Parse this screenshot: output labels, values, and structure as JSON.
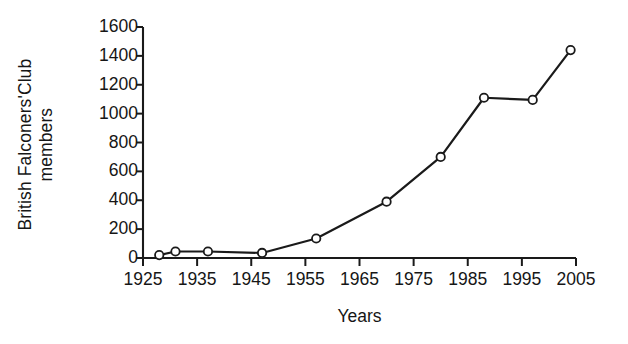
{
  "chart_data": {
    "type": "line",
    "title": "",
    "xlabel": "Years",
    "ylabel": "British Falconers'Club members",
    "ylabel_line1": "British Falconers'Club",
    "ylabel_line2": "members",
    "xlim": [
      1925,
      2005
    ],
    "ylim": [
      0,
      1600
    ],
    "xticks": [
      1925,
      1935,
      1945,
      1955,
      1965,
      1975,
      1985,
      1995,
      2005
    ],
    "yticks": [
      0,
      200,
      400,
      600,
      800,
      1000,
      1200,
      1400,
      1600
    ],
    "xtick_labels": [
      "1925",
      "1935",
      "1945",
      "1955",
      "1965",
      "1975",
      "1985",
      "1995",
      "2005"
    ],
    "ytick_labels": [
      "0",
      "200",
      "400",
      "600",
      "800",
      "1000",
      "1200",
      "1400",
      "1600"
    ],
    "grid": false,
    "legend": "none",
    "marker": "open-circle",
    "line_color": "#1a1a1a",
    "marker_fill": "#ffffff",
    "series": [
      {
        "name": "British Falconers' Club members",
        "x": [
          1928,
          1931,
          1937,
          1947,
          1957,
          1970,
          1980,
          1988,
          1997,
          2004
        ],
        "values": [
          20,
          45,
          45,
          35,
          135,
          390,
          700,
          1110,
          1095,
          1440
        ]
      }
    ]
  },
  "axes": {
    "x_axis_name": "years-axis",
    "y_axis_name": "members-axis"
  }
}
